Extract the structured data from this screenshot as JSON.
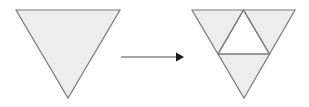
{
  "figure": {
    "width": 309,
    "height": 107,
    "background_color": "#ffffff",
    "stroke_color": "#7d7d7d",
    "stroke_width": 1.2,
    "fill_color": "#ededed",
    "hole_fill_color": "#ffffff",
    "arrow_color": "#8a8a8a",
    "arrow_head_color": "#1a1a1a"
  },
  "shapes": {
    "left_triangle": {
      "name": "solid-downward-triangle",
      "orientation": "downward",
      "vertices": [
        {
          "label": "top-left",
          "x": 16,
          "y": 10
        },
        {
          "label": "top-right",
          "x": 120,
          "y": 10
        },
        {
          "label": "bottom-apex",
          "x": 68,
          "y": 98
        }
      ],
      "points": "16,10 120,10 68,98",
      "fill": "#ededed",
      "stroke": "#7d7d7d"
    },
    "right_triangle": {
      "name": "subdivided-downward-triangle",
      "orientation": "downward",
      "vertices": [
        {
          "label": "top-left",
          "x": 192,
          "y": 10
        },
        {
          "label": "top-right",
          "x": 295,
          "y": 10
        },
        {
          "label": "bottom-apex",
          "x": 244,
          "y": 98
        }
      ],
      "points": "192,10 295,10 244,98",
      "fill": "#ededed",
      "stroke": "#7d7d7d",
      "midpoints": [
        {
          "label": "top-edge-midpoint",
          "x": 243.5,
          "y": 10
        },
        {
          "label": "left-edge-midpoint",
          "x": 218,
          "y": 54
        },
        {
          "label": "right-edge-midpoint",
          "x": 269.5,
          "y": 54
        }
      ],
      "inner_hole": {
        "name": "central-upward-triangle",
        "orientation": "upward",
        "points": "243.5,10 218,54 269.5,54",
        "fill": "#ffffff",
        "stroke": "#7d7d7d"
      },
      "sub_triangles": [
        {
          "label": "top-left-sub",
          "points": "192,10 243.5,10 218,54",
          "fill": "#ededed"
        },
        {
          "label": "top-right-sub",
          "points": "243.5,10 295,10 269.5,54",
          "fill": "#ededed"
        },
        {
          "label": "bottom-sub",
          "points": "218,54 269.5,54 244,98",
          "fill": "#ededed"
        },
        {
          "label": "center-sub-removed",
          "points": "243.5,10 218,54 269.5,54",
          "fill": "#ffffff"
        }
      ]
    }
  },
  "arrow": {
    "name": "transformation-arrow",
    "direction": "right",
    "label": "",
    "line": {
      "x1": 121,
      "y1": 57,
      "x2": 176,
      "y2": 57
    },
    "head": {
      "points": "176,52.5 184,57 176,61.5",
      "x": 184,
      "y": 57
    },
    "line_color": "#8a8a8a",
    "head_color": "#1a1a1a",
    "line_width": 1.4
  }
}
